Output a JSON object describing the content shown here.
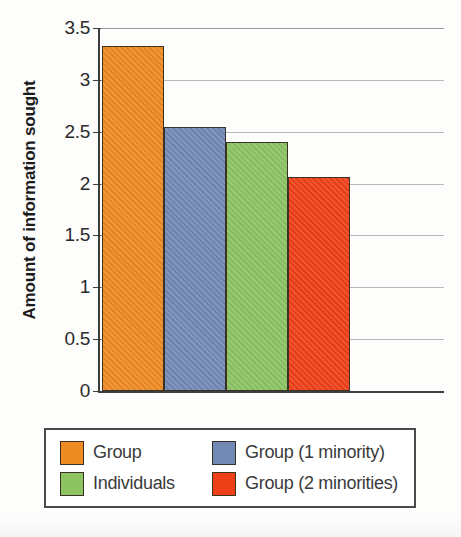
{
  "chart_data": {
    "type": "bar",
    "title": "",
    "xlabel": "",
    "ylabel": "Amount of information sought",
    "ylim": [
      0,
      3.5
    ],
    "yticks": [
      0,
      0.5,
      1,
      1.5,
      2,
      2.5,
      3,
      3.5
    ],
    "ytick_labels": [
      "0",
      "0.5",
      "1",
      "1.5",
      "2",
      "2.5",
      "3",
      "3.5"
    ],
    "grid": true,
    "legend_position": "bottom",
    "categories": [
      "Group",
      "Group (1 minority)",
      "Individuals",
      "Group (2 minorities)"
    ],
    "values": [
      3.33,
      2.55,
      2.4,
      2.06
    ],
    "colors": [
      "#ee8b22",
      "#7389b5",
      "#8cc363",
      "#ee4018"
    ],
    "bars": [
      {
        "label": "Group",
        "value": 3.33,
        "color": "#ee8b22",
        "texture": "weave"
      },
      {
        "label": "Group (1 minority)",
        "value": 2.55,
        "color": "#7389b5",
        "texture": "weave"
      },
      {
        "label": "Individuals",
        "value": 2.4,
        "color": "#8cc363",
        "texture": "weave"
      },
      {
        "label": "Group (2 minorities)",
        "value": 2.06,
        "color": "#ee4018",
        "texture": "weave"
      }
    ]
  },
  "legend": {
    "entries": [
      {
        "label": "Group",
        "color": "#ee8b22"
      },
      {
        "label": "Group (1 minority)",
        "color": "#7389b5"
      },
      {
        "label": "Individuals",
        "color": "#8cc363"
      },
      {
        "label": "Group (2 minorities)",
        "color": "#ee4018"
      }
    ]
  },
  "axis": {
    "y_title": "Amount of information sought"
  }
}
